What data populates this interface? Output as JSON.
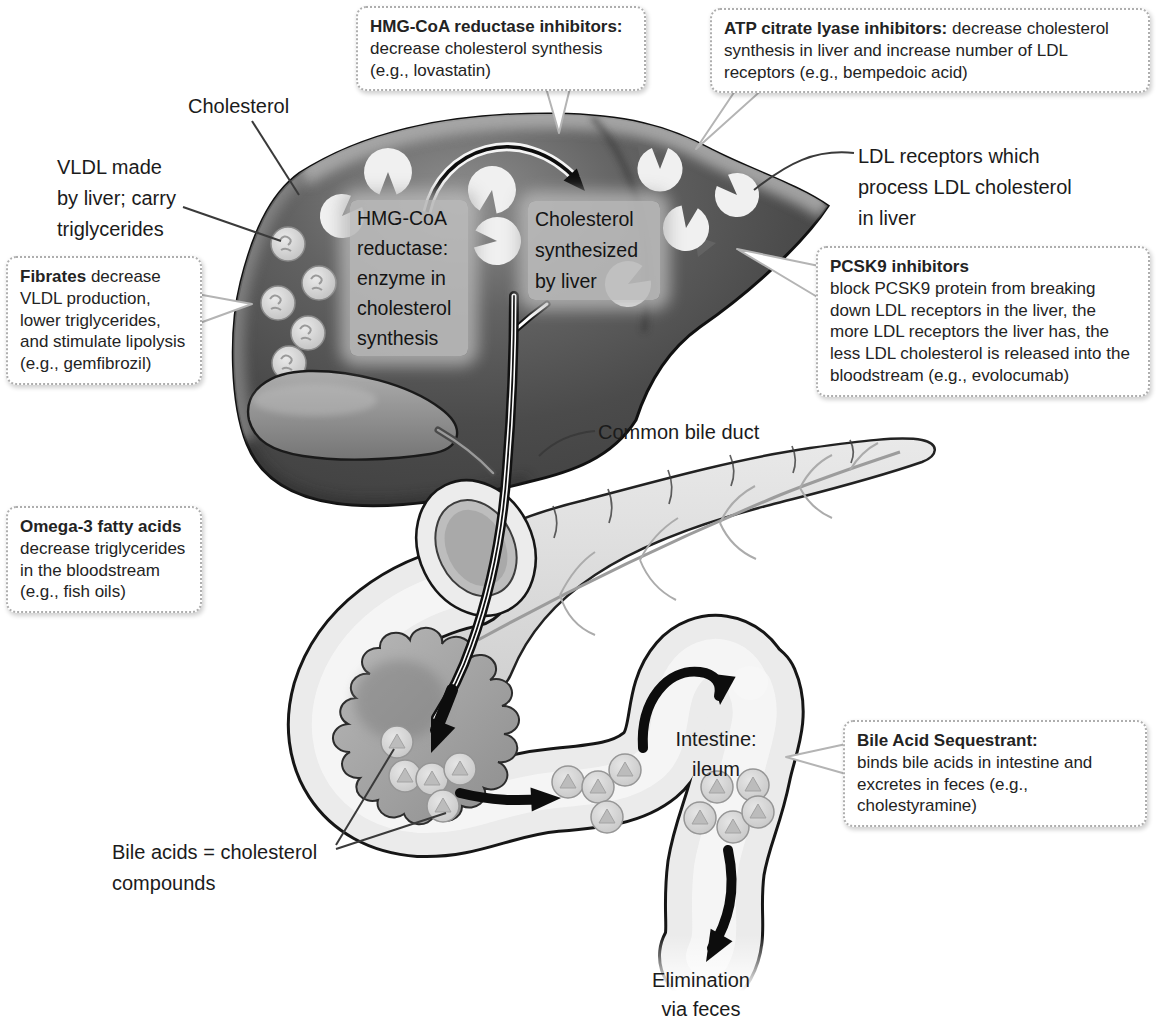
{
  "figure": {
    "callouts": {
      "hmg": {
        "lead": "HMG-CoA reductase inhibitors:",
        "body": "decrease cholesterol synthesis (e.g., lovastatin)"
      },
      "atp": {
        "lead": "ATP citrate lyase inhibitors:",
        "body": "decrease cholesterol synthesis in liver and increase number of LDL receptors (e.g., bempedoic acid)"
      },
      "fibrates": {
        "lead": "Fibrates",
        "body": "decrease VLDL production, lower triglycerides, and stimulate lipolysis (e.g., gemfibrozil)"
      },
      "pcsk9": {
        "lead": "PCSK9 inhibitors",
        "body": "block PCSK9 protein from breaking down LDL receptors in the liver, the more LDL receptors the liver has, the less LDL cholesterol is released into the bloodstream (e.g., evolocumab)"
      },
      "omega3": {
        "lead": "Omega-3 fatty acids",
        "body": "decrease triglycerides in the bloodstream (e.g., fish oils)"
      },
      "bile_sequestrant": {
        "lead": "Bile Acid Sequestrant:",
        "body": "binds bile acids in intestine and excretes in feces (e.g., cholestyramine)"
      }
    },
    "labels": {
      "cholesterol": "Cholesterol",
      "vldl_lines": [
        "VLDL made",
        "by liver; carry",
        "triglycerides"
      ],
      "ldl_lines": [
        "LDL receptors which",
        "process LDL cholesterol",
        "in liver"
      ],
      "common_bile_duct": "Common bile duct",
      "bile_acids_lines": [
        "Bile acids = cholesterol",
        "compounds"
      ],
      "intestine_lines": [
        "Intestine:",
        "ileum"
      ],
      "elimination_lines": [
        "Elimination",
        "via feces"
      ]
    },
    "liver_boxes": {
      "hmg_lines": [
        "HMG-CoA",
        "reductase:",
        "enzyme in",
        "cholesterol",
        "synthesis"
      ],
      "chol_lines": [
        "Cholesterol",
        "synthesized",
        "by liver"
      ]
    },
    "colors": {
      "liver": "#4d4d4d",
      "liver_rim": "#a8a8a8",
      "receptor": "#f0f0f0",
      "gallbladder": "#8f8f8f",
      "intestine": "#ebebeb",
      "pancreas": "#dcdcdc",
      "mucosa": "#9a9a9a",
      "outline": "#151515",
      "callout_border": "#aeaeae"
    }
  }
}
